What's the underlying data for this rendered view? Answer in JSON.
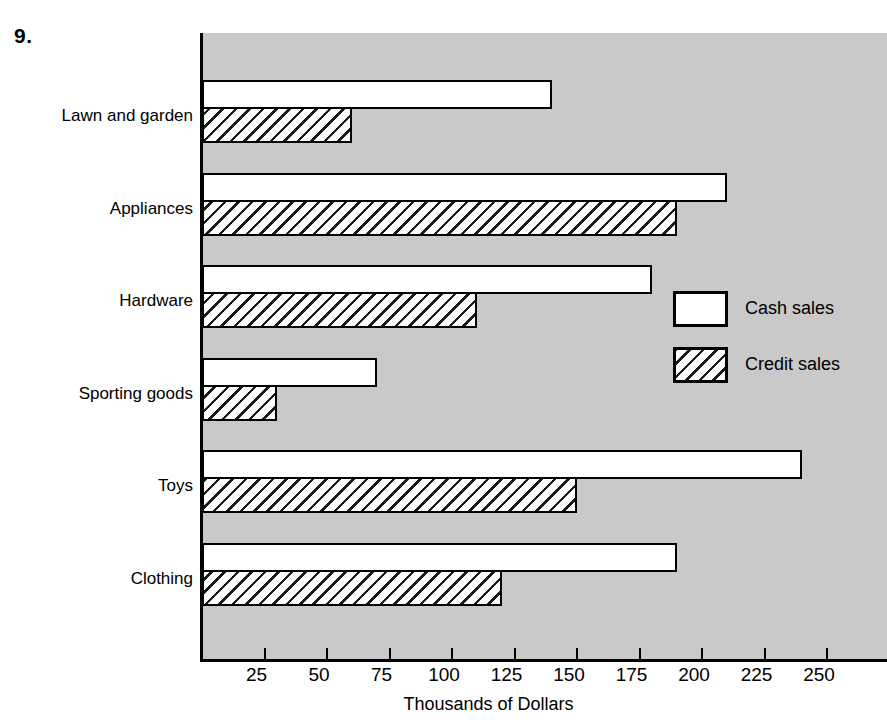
{
  "exercise": {
    "number": "9."
  },
  "legend": {
    "position": "inside-right",
    "items": [
      {
        "label": "Cash sales",
        "swatch": "solid-white",
        "icon": "legend-swatch-solid"
      },
      {
        "label": "Credit sales",
        "swatch": "diagonal-hatch",
        "icon": "legend-swatch-hatched"
      }
    ]
  },
  "colors": {
    "plot_background": "#c9c9c9",
    "page_background": "#ffffff",
    "bar_outline": "#000000",
    "cash_fill": "#ffffff",
    "credit_fill": "#ffffff"
  },
  "chart_data": {
    "type": "bar",
    "orientation": "horizontal",
    "title": "",
    "xlabel": "Thousands of Dollars",
    "ylabel": "",
    "categories": [
      "Lawn and garden",
      "Appliances",
      "Hardware",
      "Sporting goods",
      "Toys",
      "Clothing"
    ],
    "series": [
      {
        "name": "Cash sales",
        "values": [
          140,
          210,
          180,
          70,
          240,
          190
        ]
      },
      {
        "name": "Credit sales",
        "values": [
          60,
          190,
          110,
          30,
          150,
          120
        ]
      }
    ],
    "xlim": [
      0,
      274
    ],
    "xticks": [
      25,
      50,
      75,
      100,
      125,
      150,
      175,
      200,
      225,
      250
    ],
    "xtick_labels": [
      "25",
      "50",
      "75",
      "100",
      "125",
      "150",
      "175",
      "200",
      "225",
      "250"
    ],
    "grid": false,
    "legend_position": "inside-right",
    "units": "thousands of dollars"
  }
}
